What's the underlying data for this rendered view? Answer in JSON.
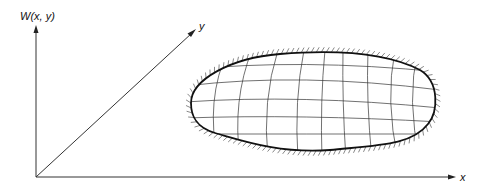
{
  "diagram": {
    "labels": {
      "z_axis": "W(x, y)",
      "y_axis": "y",
      "x_axis": "x"
    },
    "elements": {
      "axes": [
        "vertical W axis",
        "diagonal y axis",
        "horizontal x axis"
      ],
      "surface": "curvilinear mesh over a region with hatched (clamped) boundary",
      "mesh": {
        "curves_along_x": 5,
        "curves_along_y": 9
      }
    },
    "colors": {
      "line": "#333333",
      "background": "#ffffff"
    }
  }
}
